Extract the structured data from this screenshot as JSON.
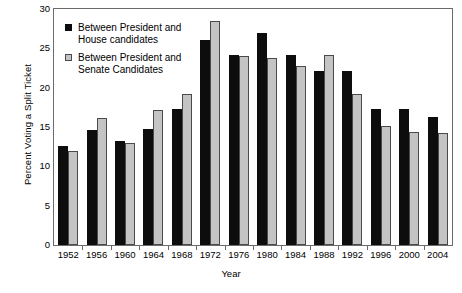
{
  "chart_data": {
    "type": "bar",
    "title": "",
    "xlabel": "Year",
    "ylabel": "Percent Voting a Split Ticket",
    "categories": [
      "1952",
      "1956",
      "1960",
      "1964",
      "1968",
      "1972",
      "1976",
      "1980",
      "1984",
      "1988",
      "1992",
      "1996",
      "2000",
      "2004"
    ],
    "series": [
      {
        "name": "Between President and House candidates",
        "color": "#0d0d0d",
        "values": [
          12.6,
          14.6,
          13.2,
          14.7,
          17.3,
          26.0,
          24.2,
          26.9,
          24.2,
          22.1,
          22.1,
          17.3,
          17.3,
          16.3
        ]
      },
      {
        "name": "Between President and Senate Candidates",
        "color": "#c4c4c4",
        "values": [
          12.0,
          16.1,
          13.0,
          17.2,
          19.2,
          28.5,
          24.0,
          23.8,
          22.8,
          24.2,
          19.2,
          15.1,
          14.4,
          14.3
        ]
      }
    ],
    "ylim": [
      0,
      30
    ],
    "yticks": [
      0,
      5,
      10,
      15,
      20,
      25,
      30
    ],
    "ytick_labels": [
      "0",
      "5",
      "10",
      "15",
      "20",
      "25",
      "30"
    ],
    "grid": false,
    "legend_position": "upper-left"
  },
  "legend": {
    "items": [
      {
        "swatch": "house",
        "line1": "Between President and",
        "line2": "House candidates"
      },
      {
        "swatch": "senate",
        "line1": "Between President and",
        "line2": "Senate Candidates"
      }
    ]
  }
}
